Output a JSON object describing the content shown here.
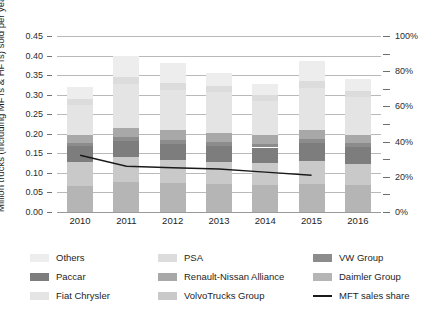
{
  "axis": {
    "y_left_title": "Million trucks (including MFTs & HFTs) sold per year",
    "y_left_ticks": [
      "0.45",
      "0.40",
      "0.35",
      "0.30",
      "0.25",
      "0.20",
      "0.15",
      "0.10",
      "0.05",
      "0.00"
    ],
    "y_right_ticks": [
      "100%",
      "80%",
      "60%",
      "40%",
      "20%",
      "0%"
    ],
    "x_ticks": [
      "2010",
      "2011",
      "2012",
      "2013",
      "2014",
      "2015",
      "2016"
    ]
  },
  "legend": {
    "items": [
      {
        "label": "Others",
        "color": "#ededed",
        "type": "swatch",
        "name": "others"
      },
      {
        "label": "PSA",
        "color": "#dcdcdc",
        "type": "swatch",
        "name": "psa"
      },
      {
        "label": "VW Group",
        "color": "#8c8c8c",
        "type": "swatch",
        "name": "vw-group"
      },
      {
        "label": "Paccar",
        "color": "#7d7d7d",
        "type": "swatch",
        "name": "paccar"
      },
      {
        "label": "Renault-Nissan Alliance",
        "color": "#a8a8a8",
        "type": "swatch",
        "name": "renault-nissan-alliance"
      },
      {
        "label": "Daimler Group",
        "color": "#b5b5b5",
        "type": "swatch",
        "name": "daimler-group"
      },
      {
        "label": "Fiat Chrysler",
        "color": "#e4e4e4",
        "type": "swatch",
        "name": "fiat-chrysler"
      },
      {
        "label": "VolvoTrucks Group",
        "color": "#c9c9c9",
        "type": "swatch",
        "name": "volvotrucks-group"
      },
      {
        "label": "MFT sales share",
        "color": "#1a1a1a",
        "type": "line",
        "name": "mft-sales-share"
      }
    ]
  },
  "chart_data": {
    "type": "bar",
    "title": "",
    "xlabel": "",
    "ylabel": "Million trucks (including MFTs & HFTs) sold per year",
    "ylim": [
      0,
      0.45
    ],
    "ytick_step": 0.05,
    "y2label": "",
    "y2lim": [
      0,
      100
    ],
    "y2tick_step": 20,
    "grid": true,
    "stacked": true,
    "legend_position": "bottom",
    "categories": [
      "2010",
      "2011",
      "2012",
      "2013",
      "2014",
      "2015",
      "2016"
    ],
    "series": [
      {
        "name": "Daimler Group",
        "color": "#b5b5b5",
        "values": [
          0.066,
          0.076,
          0.074,
          0.071,
          0.07,
          0.072,
          0.069
        ]
      },
      {
        "name": "VolvoTrucks Group",
        "color": "#c9c9c9",
        "values": [
          0.062,
          0.064,
          0.06,
          0.058,
          0.055,
          0.058,
          0.055
        ]
      },
      {
        "name": "Paccar",
        "color": "#7d7d7d",
        "values": [
          0.04,
          0.042,
          0.041,
          0.041,
          0.04,
          0.046,
          0.042
        ]
      },
      {
        "name": "VW Group",
        "color": "#8c8c8c",
        "values": [
          0.008,
          0.01,
          0.01,
          0.01,
          0.01,
          0.01,
          0.01
        ]
      },
      {
        "name": "Renault-Nissan Alliance",
        "color": "#a8a8a8",
        "values": [
          0.022,
          0.024,
          0.024,
          0.022,
          0.022,
          0.024,
          0.022
        ]
      },
      {
        "name": "Fiat Chrysler",
        "color": "#e4e4e4",
        "values": [
          0.076,
          0.112,
          0.104,
          0.104,
          0.086,
          0.108,
          0.096
        ]
      },
      {
        "name": "PSA",
        "color": "#dcdcdc",
        "values": [
          0.016,
          0.018,
          0.018,
          0.016,
          0.016,
          0.018,
          0.016
        ]
      },
      {
        "name": "Others",
        "color": "#ededed",
        "values": [
          0.03,
          0.054,
          0.051,
          0.033,
          0.029,
          0.05,
          0.03
        ]
      }
    ],
    "line_series": {
      "name": "MFT sales share",
      "color": "#1a1a1a",
      "axis": "secondary",
      "x": [
        "2010",
        "2011",
        "2012",
        "2013",
        "2014",
        "2015"
      ],
      "values_fraction": [
        0.145,
        0.117,
        0.113,
        0.11,
        0.102,
        0.094
      ],
      "values_percent": [
        32,
        26,
        25,
        24,
        23,
        21
      ]
    }
  }
}
